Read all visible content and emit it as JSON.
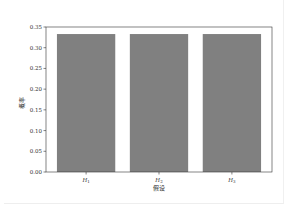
{
  "chart_data": {
    "type": "bar",
    "title": "",
    "categories": [
      "H1",
      "H2",
      "H3"
    ],
    "category_labels_display": [
      "H₁",
      "H₂",
      "H₃"
    ],
    "values": [
      0.333,
      0.333,
      0.333
    ],
    "xlabel": "假设",
    "ylabel": "概率",
    "ylim": [
      0.0,
      0.35
    ],
    "yticks": [
      "0.00",
      "0.05",
      "0.10",
      "0.15",
      "0.20",
      "0.25",
      "0.30",
      "0.35"
    ],
    "grid": false,
    "legend": null,
    "bar_color": "#808080"
  }
}
